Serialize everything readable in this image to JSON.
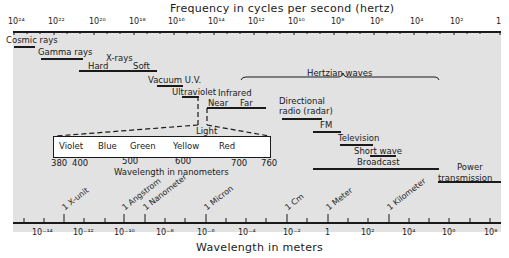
{
  "title_top": "Frequency in cycles per second (hertz)",
  "title_bottom": "Wavelength in meters",
  "freq_ticks": [
    {
      "label": "10²⁴",
      "x": 8
    },
    {
      "label": "10²²",
      "x": 48
    },
    {
      "label": "10²⁰",
      "x": 89
    },
    {
      "label": "10¹⁸",
      "x": 129
    },
    {
      "label": "10¹⁶",
      "x": 168
    },
    {
      "label": "10¹⁴",
      "x": 208
    },
    {
      "label": "10¹²",
      "x": 248
    },
    {
      "label": "10¹⁰",
      "x": 288
    },
    {
      "label": "10⁸",
      "x": 331
    },
    {
      "label": "10⁶",
      "x": 370
    },
    {
      "label": "10⁴",
      "x": 410
    },
    {
      "label": "10²",
      "x": 450
    },
    {
      "label": "1",
      "x": 496
    }
  ],
  "wavelength_ticks": [
    {
      "label": "10⁻¹⁴",
      "x": 32
    },
    {
      "label": "10⁻¹²",
      "x": 73
    },
    {
      "label": "10⁻¹⁰",
      "x": 114
    },
    {
      "label": "10⁻⁸",
      "x": 156
    },
    {
      "label": "10⁻⁶",
      "x": 197
    },
    {
      "label": "10⁻⁴",
      "x": 238
    },
    {
      "label": "10⁻²",
      "x": 283
    },
    {
      "label": "1",
      "x": 325
    },
    {
      "label": "10²",
      "x": 361
    },
    {
      "label": "10⁴",
      "x": 402
    },
    {
      "label": "10⁶",
      "x": 442
    },
    {
      "label": "10⁸",
      "x": 484
    }
  ],
  "unit_markers": [
    {
      "label": "1 X-unit",
      "x": 64
    },
    {
      "label": "1 Angstrom",
      "x": 126
    },
    {
      "label": "1 Nanometer",
      "x": 146
    },
    {
      "label": "1 Micron",
      "x": 206
    },
    {
      "label": "1 Cm",
      "x": 287
    },
    {
      "label": "1 Meter",
      "x": 328
    },
    {
      "label": "1 Kilometer",
      "x": 389
    }
  ],
  "bands": {
    "cosmic_rays": "Cosmic rays",
    "gamma_rays": "Gamma rays",
    "x_rays": "X-rays",
    "hard": "Hard",
    "soft": "Soft",
    "vacuum_uv": "Vacuum U.V.",
    "ultraviolet": "Ultraviolet",
    "infrared": "Infrared",
    "near": "Near",
    "far": "Far",
    "hertzian": "Hertzian waves",
    "radar_line1": "Directional",
    "radar_line2": "radio (radar)",
    "fm": "FM",
    "television": "Television",
    "short_wave": "Short wave",
    "broadcast": "Broadcast",
    "power_line1": "Power",
    "power_line2": "transmission",
    "light": "Light"
  },
  "visible": {
    "colors": [
      "Violet",
      "Blue",
      "Green",
      "Yellow",
      "Red"
    ],
    "ticks": [
      "380",
      "400",
      "500",
      "600",
      "700",
      "760"
    ],
    "caption": "Wavelength in nanometers"
  }
}
